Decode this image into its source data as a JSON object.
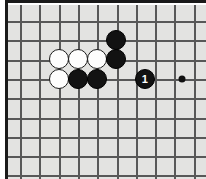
{
  "figure": {
    "kind": "go-board-diagram",
    "width": 206,
    "height": 179,
    "board_color": "#e3e3e1",
    "line_color": "#585858",
    "border_color": "#1a1a1a",
    "background_color": "#ffffff"
  },
  "grid": {
    "origin_x": 14,
    "origin_y": 16,
    "spacing": 19.3,
    "columns": 10,
    "rows": 9,
    "visible": true
  },
  "star_points": [
    {
      "name": "hoshi-right",
      "x": 176,
      "y": 74
    }
  ],
  "stones": [
    {
      "name": "white-stone-1",
      "color": "white",
      "x": 53,
      "y": 54,
      "label": ""
    },
    {
      "name": "white-stone-2",
      "color": "white",
      "x": 72,
      "y": 54,
      "label": ""
    },
    {
      "name": "white-stone-3",
      "color": "white",
      "x": 91,
      "y": 54,
      "label": ""
    },
    {
      "name": "white-stone-4",
      "color": "white",
      "x": 53,
      "y": 74,
      "label": ""
    },
    {
      "name": "black-stone-1",
      "color": "black",
      "x": 110,
      "y": 35,
      "label": ""
    },
    {
      "name": "black-stone-2",
      "color": "black",
      "x": 110,
      "y": 54,
      "label": ""
    },
    {
      "name": "black-stone-3",
      "color": "black",
      "x": 72,
      "y": 74,
      "label": ""
    },
    {
      "name": "black-stone-4",
      "color": "black",
      "x": 91,
      "y": 74,
      "label": ""
    },
    {
      "name": "black-move-1",
      "color": "black",
      "x": 139,
      "y": 74,
      "label": "1"
    }
  ]
}
